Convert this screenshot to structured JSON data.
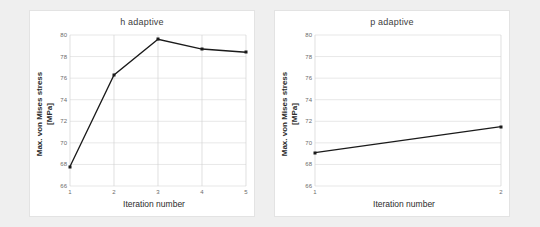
{
  "figure": {
    "background_color": "#efefef",
    "panel_color": "#ffffff"
  },
  "chart_data": [
    {
      "type": "line",
      "panel": "left",
      "title": "h adaptive",
      "xlabel": "Iteration number",
      "ylabel": "Max. von Mises stress\n[MPa]",
      "ylabel_line1": "Max. von Mises stress",
      "ylabel_line2": "[MPa]",
      "x": [
        1,
        2,
        3,
        4,
        5
      ],
      "values": [
        67.8,
        76.3,
        79.6,
        78.7,
        78.4
      ],
      "categories": [
        "1",
        "2",
        "3",
        "4",
        "5"
      ],
      "xticks": [
        "1",
        "2",
        "3",
        "4",
        "5"
      ],
      "yticks": [
        "66",
        "68",
        "70",
        "72",
        "74",
        "76",
        "78",
        "80"
      ],
      "xlim": [
        1,
        5
      ],
      "ylim": [
        66,
        80
      ],
      "grid": true,
      "legend": false,
      "line_color": "#1a1a1a",
      "marker": "square"
    },
    {
      "type": "line",
      "panel": "right",
      "title": "p adaptive",
      "xlabel": "Iteration number",
      "ylabel": "Max. von Mises stress\n[MPa]",
      "ylabel_line1": "Max. von Mises stress",
      "ylabel_line2": "[MPa]",
      "x": [
        1,
        2
      ],
      "values": [
        69.1,
        71.5
      ],
      "categories": [
        "1",
        "2"
      ],
      "xticks": [
        "1",
        "2"
      ],
      "yticks": [
        "66",
        "68",
        "70",
        "72",
        "74",
        "76",
        "78",
        "80"
      ],
      "xlim": [
        1,
        2
      ],
      "ylim": [
        66,
        80
      ],
      "grid": true,
      "legend": false,
      "line_color": "#1a1a1a",
      "marker": "square"
    }
  ]
}
